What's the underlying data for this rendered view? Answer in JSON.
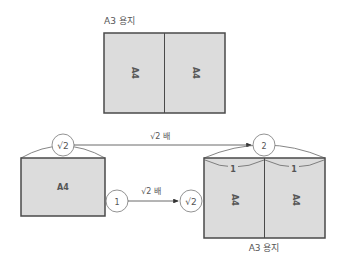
{
  "top_diagram": {
    "caption": "A3 용지",
    "left_label": "A4",
    "right_label": "A4"
  },
  "bottom_diagram": {
    "source_box_label": "A4",
    "source_width_marker": "√2",
    "source_height_marker": "1",
    "top_arrow_label": "√2 배",
    "middle_arrow_label": "√2 배",
    "target_width_marker": "2",
    "target_height_marker": "√2",
    "target_half_left": "1",
    "target_half_right": "1",
    "target_left_label": "A4",
    "target_right_label": "A4",
    "target_caption": "A3 용지"
  },
  "colors": {
    "fill": "#dcdcdc",
    "stroke": "#4a4a4a",
    "text": "#555555"
  }
}
